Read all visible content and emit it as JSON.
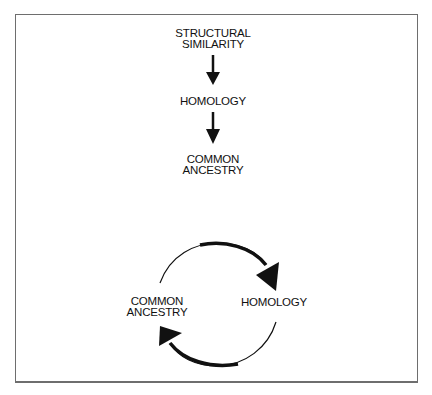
{
  "linear_flow": {
    "nodes": [
      {
        "line1": "STRUCTURAL",
        "line2": "SIMILARITY"
      },
      {
        "line1": "HOMOLOGY"
      },
      {
        "line1": "COMMON",
        "line2": "ANCESTRY"
      }
    ],
    "arrows": [
      "down-arrow",
      "down-arrow"
    ]
  },
  "circular_flow": {
    "left_node": {
      "line1": "COMMON",
      "line2": "ANCESTRY"
    },
    "right_node": {
      "line1": "HOMOLOGY"
    },
    "arrows": [
      "clockwise-arc-arrow-top",
      "clockwise-arc-arrow-bottom"
    ]
  },
  "colors": {
    "ink": "#111111",
    "frame": "#6e6e6e",
    "background": "#ffffff"
  }
}
